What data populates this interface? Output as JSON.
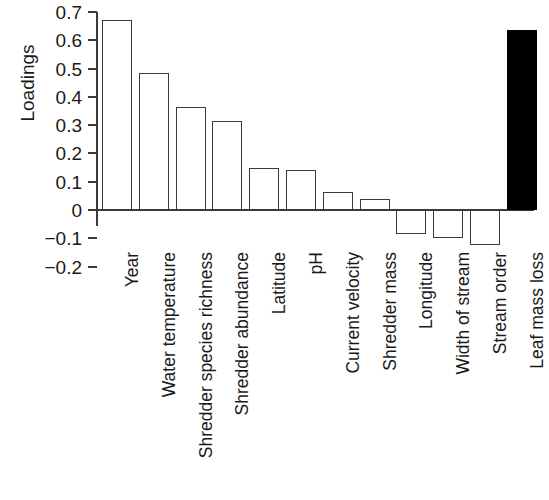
{
  "chart_data": {
    "type": "bar",
    "title": "",
    "xlabel": "",
    "ylabel": "Loadings",
    "ylim": [
      -0.2,
      0.7
    ],
    "yticks": [
      "0.7",
      "0.6",
      "0.5",
      "0.4",
      "0.3",
      "0.2",
      "0.1",
      "0",
      "−0.1",
      "−0.2"
    ],
    "ytick_values": [
      0.7,
      0.6,
      0.5,
      0.4,
      0.3,
      0.2,
      0.1,
      0,
      -0.1,
      -0.2
    ],
    "grid": false,
    "legend": "none",
    "categories": [
      "Year",
      "Water temperature",
      "Shredder species richness",
      "Shredder abundance",
      "Latitude",
      "pH",
      "Current velocity",
      "Shredder mass",
      "Longitude",
      "Width of stream",
      "Stream order",
      "Leaf mass loss"
    ],
    "values": [
      0.67,
      0.485,
      0.365,
      0.315,
      0.15,
      0.14,
      0.065,
      0.04,
      -0.085,
      -0.1,
      -0.125,
      0.635
    ],
    "bar_styles": [
      "open",
      "open",
      "open",
      "open",
      "open",
      "open",
      "open",
      "open",
      "open",
      "open",
      "open",
      "filled"
    ],
    "colors": {
      "open_fill": "#ffffff",
      "filled_fill": "#000000",
      "outline": "#3a3a3a",
      "axis": "#3a3a3a",
      "text": "#1a1a1a"
    }
  }
}
